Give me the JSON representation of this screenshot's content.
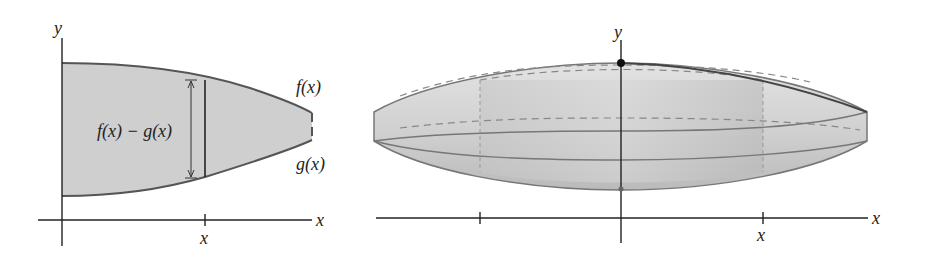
{
  "left_figure": {
    "axis_y_label": "y",
    "axis_x_label": "x",
    "tick_label": "x",
    "top_curve_label": "f(x)",
    "bottom_curve_label": "g(x)",
    "strip_label": "f(x) − g(x)"
  },
  "right_figure": {
    "axis_y_label": "y",
    "axis_x_label": "x",
    "tick_label": "x"
  },
  "colors": {
    "region_fill": "#cfcfcf",
    "curve_stroke": "#555555",
    "axis_stroke": "#222222",
    "solid_fill": "#d6d6d6",
    "cylinder_fill": "#bdbdbd"
  }
}
